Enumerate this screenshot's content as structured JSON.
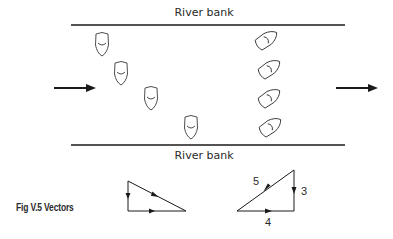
{
  "figure": {
    "caption": "Fig V.5  Vectors",
    "colors": {
      "ink": "#1a1a1a",
      "boat_stroke": "#3a3a3a",
      "background": "#ffffff"
    }
  },
  "river": {
    "top_bank_label": "River bank",
    "bottom_bank_label": "River bank",
    "current_arrows": [
      {
        "name": "current-arrow-left",
        "direction": "right"
      },
      {
        "name": "current-arrow-right",
        "direction": "right"
      }
    ],
    "boats_heading_straight": 4,
    "boats_heading_angled": 4
  },
  "vector_triangles": [
    {
      "name": "triangle-left",
      "sides": [
        {
          "side": "vertical",
          "direction": "down",
          "label": ""
        },
        {
          "side": "horizontal",
          "direction": "right",
          "label": ""
        },
        {
          "side": "hypotenuse",
          "direction": "down-right",
          "label": ""
        }
      ]
    },
    {
      "name": "triangle-right",
      "sides": [
        {
          "side": "vertical",
          "direction": "down",
          "label": "3"
        },
        {
          "side": "horizontal",
          "direction": "right",
          "label": "4"
        },
        {
          "side": "hypotenuse",
          "direction": "down-left",
          "label": "5"
        }
      ]
    }
  ]
}
